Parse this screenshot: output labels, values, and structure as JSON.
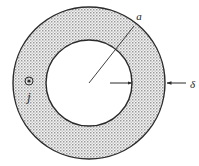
{
  "figure": {
    "background_color": "#ffffff",
    "outline_color": "#2b2b2b",
    "hatch_color": "#8c8c8c",
    "hatch_background": "#f2f2f2",
    "labels": {
      "outer_radius": "a",
      "wall_thickness": "δ",
      "current_density": "j"
    },
    "geometry": {
      "center_x": 89,
      "center_y": 83,
      "outer_radius_px": 76,
      "inner_radius_px": 43,
      "wall_thickness_px": 33
    },
    "annotations": {
      "radius_line": {
        "from_x": 89,
        "from_y": 83,
        "to_x": 134,
        "to_y": 26,
        "label": "a",
        "label_x": 139,
        "label_y": 19
      },
      "thickness_marker_outer": {
        "arrow_from_x": 186,
        "arrow_from_y": 83,
        "arrow_to_x": 166,
        "arrow_to_y": 83,
        "label": "δ",
        "label_x": 190,
        "label_y": 87
      },
      "thickness_marker_inner": {
        "arrow_from_x": 110,
        "arrow_from_y": 83,
        "arrow_to_x": 133,
        "arrow_to_y": 83
      },
      "current_symbol": {
        "circle_x": 29,
        "circle_y": 81,
        "circle_r": 4,
        "dot_r": 1.6,
        "label": "j",
        "label_x": 29,
        "label_y": 100
      }
    }
  }
}
